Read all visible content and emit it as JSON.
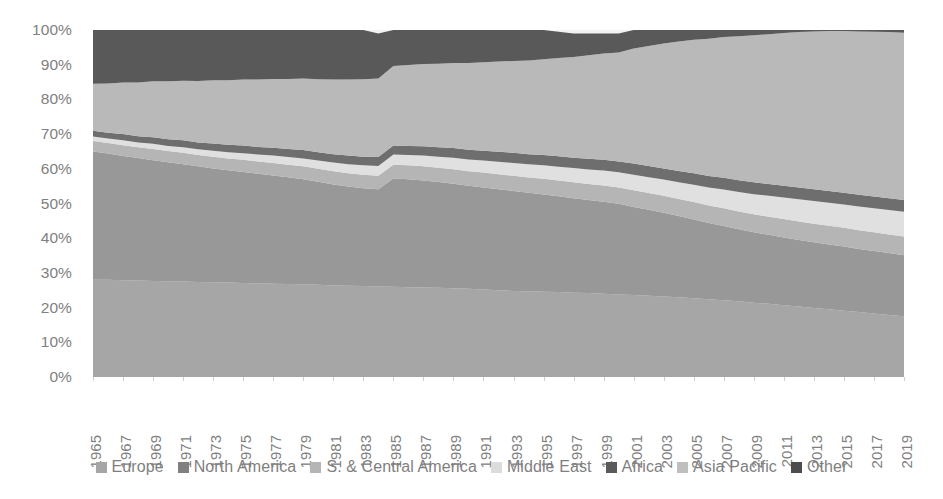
{
  "chart_data": {
    "type": "area",
    "title": "",
    "subtitle": "",
    "xlabel": "",
    "ylabel": "",
    "stacked": true,
    "normalized": true,
    "grid": false,
    "legend_position": "bottom",
    "ylim": [
      0,
      100
    ],
    "ytick_labels": [
      "100%",
      "90%",
      "80%",
      "70%",
      "60%",
      "50%",
      "40%",
      "30%",
      "20%",
      "10%",
      "0%"
    ],
    "ytick_values": [
      100,
      90,
      80,
      70,
      60,
      50,
      40,
      30,
      20,
      10,
      0
    ],
    "x": [
      1965,
      1966,
      1967,
      1968,
      1969,
      1970,
      1971,
      1972,
      1973,
      1974,
      1975,
      1976,
      1977,
      1978,
      1979,
      1980,
      1981,
      1982,
      1983,
      1984,
      1985,
      1986,
      1987,
      1988,
      1989,
      1990,
      1991,
      1992,
      1993,
      1994,
      1995,
      1996,
      1997,
      1998,
      1999,
      2000,
      2001,
      2002,
      2003,
      2004,
      2005,
      2006,
      2007,
      2008,
      2009,
      2010,
      2011,
      2012,
      2013,
      2014,
      2015,
      2016,
      2017,
      2018,
      2019
    ],
    "xtick_labels": [
      "1965",
      "1967",
      "1969",
      "1971",
      "1973",
      "1975",
      "1977",
      "1979",
      "1981",
      "1983",
      "1985",
      "1987",
      "1989",
      "1991",
      "1993",
      "1995",
      "1997",
      "1999",
      "2001",
      "2003",
      "2005",
      "2007",
      "2009",
      "2011",
      "2013",
      "2015",
      "2017",
      "2019"
    ],
    "series": [
      {
        "name": "Europe",
        "color": "#a6a6a6",
        "values": [
          28.0,
          28.0,
          27.9,
          27.8,
          27.7,
          27.6,
          27.5,
          27.4,
          27.3,
          27.2,
          27.1,
          27.0,
          26.9,
          26.8,
          26.7,
          26.6,
          26.4,
          26.3,
          26.2,
          26.1,
          26.0,
          25.9,
          25.8,
          25.7,
          25.6,
          25.4,
          25.2,
          25.0,
          24.8,
          24.7,
          24.6,
          24.5,
          24.3,
          24.2,
          24.0,
          23.8,
          23.6,
          23.4,
          23.2,
          23.0,
          22.7,
          22.4,
          22.1,
          21.8,
          21.4,
          21.1,
          20.7,
          20.3,
          19.9,
          19.5,
          19.1,
          18.7,
          18.3,
          17.9,
          17.5
        ]
      },
      {
        "name": "North America",
        "color": "#989898",
        "values": [
          37.0,
          36.4,
          35.8,
          35.3,
          34.8,
          34.3,
          33.8,
          33.3,
          32.8,
          32.4,
          32.0,
          31.6,
          31.2,
          30.8,
          30.3,
          29.7,
          29.1,
          28.6,
          28.2,
          28.0,
          31.2,
          31.1,
          30.8,
          30.5,
          30.1,
          29.7,
          29.4,
          29.1,
          28.8,
          28.4,
          28.0,
          27.6,
          27.2,
          26.8,
          26.5,
          26.1,
          25.4,
          24.8,
          24.1,
          23.4,
          22.7,
          22.0,
          21.4,
          20.8,
          20.3,
          19.9,
          19.5,
          19.2,
          18.9,
          18.7,
          18.5,
          18.2,
          18.0,
          17.8,
          17.6
        ]
      },
      {
        "name": "S. & Central America",
        "color": "#b5b5b5",
        "values": [
          3.0,
          3.0,
          3.1,
          3.1,
          3.2,
          3.2,
          3.3,
          3.3,
          3.4,
          3.4,
          3.5,
          3.5,
          3.6,
          3.6,
          3.7,
          3.7,
          3.8,
          3.8,
          3.9,
          3.9,
          4.0,
          4.0,
          4.1,
          4.1,
          4.2,
          4.2,
          4.3,
          4.3,
          4.4,
          4.4,
          4.5,
          4.5,
          4.6,
          4.6,
          4.7,
          4.7,
          4.8,
          4.8,
          4.9,
          4.9,
          5.0,
          5.0,
          5.1,
          5.1,
          5.2,
          5.2,
          5.3,
          5.3,
          5.4,
          5.4,
          5.4,
          5.4,
          5.4,
          5.4,
          5.4
        ]
      },
      {
        "name": "Middle East",
        "color": "#e0e0e0",
        "values": [
          1.3,
          1.3,
          1.4,
          1.4,
          1.5,
          1.5,
          1.6,
          1.6,
          1.7,
          1.8,
          1.9,
          2.0,
          2.1,
          2.2,
          2.3,
          2.4,
          2.5,
          2.6,
          2.7,
          2.8,
          2.9,
          3.0,
          3.1,
          3.2,
          3.3,
          3.4,
          3.5,
          3.6,
          3.7,
          3.8,
          3.9,
          4.0,
          4.1,
          4.2,
          4.3,
          4.4,
          4.5,
          4.6,
          4.7,
          4.8,
          5.0,
          5.2,
          5.4,
          5.6,
          5.8,
          6.0,
          6.2,
          6.4,
          6.5,
          6.6,
          6.7,
          6.8,
          6.9,
          7.0,
          7.1
        ]
      },
      {
        "name": "Africa",
        "color": "#6e6e6e",
        "values": [
          1.7,
          1.7,
          1.8,
          1.8,
          1.9,
          1.9,
          2.0,
          2.0,
          2.1,
          2.1,
          2.2,
          2.2,
          2.3,
          2.3,
          2.4,
          2.4,
          2.4,
          2.5,
          2.5,
          2.6,
          2.6,
          2.6,
          2.7,
          2.7,
          2.8,
          2.8,
          2.8,
          2.9,
          2.9,
          2.9,
          3.0,
          3.0,
          3.0,
          3.1,
          3.1,
          3.1,
          3.2,
          3.2,
          3.2,
          3.3,
          3.3,
          3.3,
          3.4,
          3.4,
          3.4,
          3.4,
          3.4,
          3.4,
          3.4,
          3.4,
          3.4,
          3.4,
          3.4,
          3.4,
          3.4
        ]
      },
      {
        "name": "Asia Pacific",
        "color": "#b9b9b9",
        "values": [
          13.5,
          14.2,
          14.9,
          15.5,
          16.1,
          16.7,
          17.2,
          17.7,
          18.2,
          18.6,
          19.0,
          19.4,
          19.8,
          20.2,
          20.6,
          21.0,
          21.5,
          21.9,
          22.3,
          22.6,
          22.9,
          23.3,
          23.7,
          24.1,
          24.5,
          25.0,
          25.5,
          26.0,
          26.5,
          27.0,
          27.6,
          28.3,
          29.0,
          29.8,
          30.6,
          31.4,
          33.2,
          34.6,
          36.0,
          37.3,
          38.5,
          39.6,
          40.6,
          41.5,
          42.4,
          43.2,
          44.0,
          44.8,
          45.5,
          46.1,
          46.6,
          47.1,
          47.5,
          47.9,
          48.2
        ]
      },
      {
        "name": "Other",
        "color": "#595959",
        "values": [
          15.5,
          15.4,
          15.1,
          15.1,
          14.8,
          14.8,
          14.6,
          14.7,
          14.5,
          14.5,
          14.3,
          14.3,
          14.1,
          14.1,
          14.0,
          14.2,
          14.3,
          14.3,
          14.2,
          13.0,
          10.4,
          10.1,
          9.8,
          9.7,
          9.5,
          9.5,
          9.3,
          9.1,
          8.9,
          8.8,
          8.4,
          7.6,
          6.8,
          6.3,
          5.8,
          5.5,
          5.3,
          5.6,
          5.9,
          6.3,
          6.8,
          7.5,
          6.0,
          5.8,
          5.5,
          5.2,
          4.9,
          4.6,
          5.4,
          5.3,
          5.3,
          5.4,
          5.5,
          5.6,
          5.8
        ]
      }
    ]
  },
  "legend": {
    "items": [
      {
        "label": "Europe",
        "color": "#a6a6a6"
      },
      {
        "label": "North America",
        "color": "#808080"
      },
      {
        "label": "S. & Central America",
        "color": "#b5b5b5"
      },
      {
        "label": "Middle East",
        "color": "#dcdcdc"
      },
      {
        "label": "Africa",
        "color": "#5a5a5a"
      },
      {
        "label": "Asia Pacific",
        "color": "#bfbfbf"
      },
      {
        "label": "Other",
        "color": "#4d4d4d"
      }
    ]
  },
  "plot_area": {
    "background": "#f2f2f2"
  }
}
